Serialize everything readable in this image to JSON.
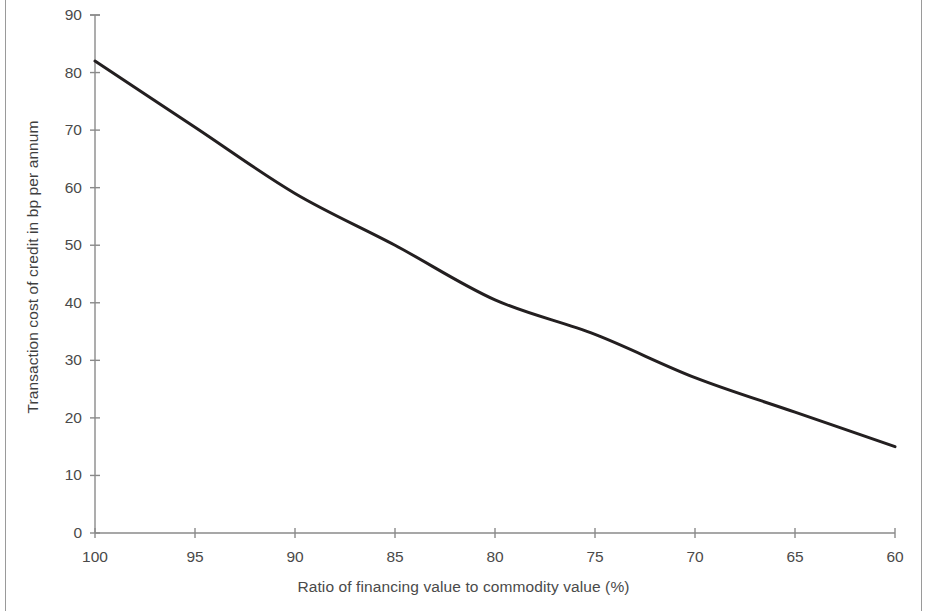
{
  "chart_data": {
    "type": "line",
    "title": "",
    "subtitle": "",
    "xlabel": "Ratio of financing value to commodity value (%)",
    "ylabel": "Transaction cost of credit in bp per annum",
    "x": [
      100,
      95,
      90,
      85,
      80,
      75,
      70,
      65,
      60
    ],
    "xtick_labels": [
      "100",
      "95",
      "90",
      "85",
      "80",
      "75",
      "70",
      "65",
      "60"
    ],
    "ytick_labels": [
      "0",
      "10",
      "20",
      "30",
      "40",
      "50",
      "60",
      "70",
      "80",
      "90"
    ],
    "yticks": [
      0,
      10,
      20,
      30,
      40,
      50,
      60,
      70,
      80,
      90
    ],
    "xlim": [
      100,
      60
    ],
    "ylim": [
      0,
      90
    ],
    "x_axis_direction": "descending",
    "grid": false,
    "legend": false,
    "legend_position": "none",
    "series": [
      {
        "name": "Transaction cost of credit",
        "color": "#231f20",
        "line_width": 3,
        "values": [
          82,
          70.5,
          59,
          50,
          40.5,
          34.5,
          27,
          21,
          15
        ]
      }
    ],
    "annotations": []
  },
  "figure": {
    "axis_color": "#8a8a8a",
    "tick_label_color": "#4a4a4a",
    "background": "#ffffff",
    "border_color": "#9a9a9a"
  }
}
